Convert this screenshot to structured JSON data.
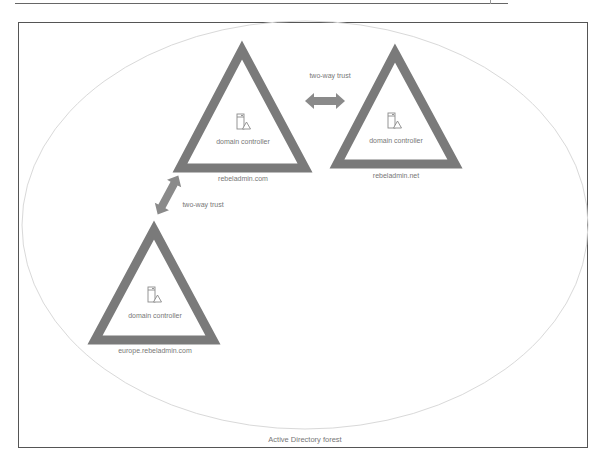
{
  "diagram": {
    "forest": {
      "label": "Active Directory forest"
    },
    "domains": [
      {
        "name": "rebeladmin.com",
        "controller_label": "domain controller",
        "icon": "domain-controller-icon"
      },
      {
        "name": "rebeladmin.net",
        "controller_label": "domain controller",
        "icon": "domain-controller-icon"
      },
      {
        "name": "europe.rebeladmin.com",
        "controller_label": "domain controller",
        "icon": "domain-controller-icon"
      }
    ],
    "trusts": [
      {
        "label": "two-way trust",
        "from": "rebeladmin.com",
        "to": "rebeladmin.net"
      },
      {
        "label": "two-way trust",
        "from": "rebeladmin.com",
        "to": "europe.rebeladmin.com"
      }
    ],
    "colors": {
      "triangle": "#7a7a7a",
      "arrow": "#8a8a8a",
      "ellipse": "#d8d8d8",
      "text": "#777777",
      "frame": "#555555"
    }
  }
}
